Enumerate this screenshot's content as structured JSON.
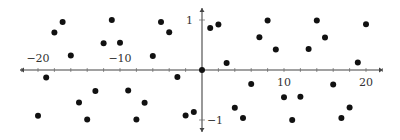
{
  "chart_data": {
    "type": "scatter",
    "title": "",
    "xlabel": "",
    "ylabel": "",
    "xlim": [
      -22,
      22
    ],
    "ylim": [
      -1.2,
      1.3
    ],
    "grid": false,
    "legend": null,
    "x_ticks": [
      {
        "value": -20,
        "label": "−20"
      },
      {
        "value": -10,
        "label": "−10"
      },
      {
        "value": 10,
        "label": "10"
      },
      {
        "value": 20,
        "label": "20"
      }
    ],
    "y_ticks": [
      {
        "value": 1,
        "label": "1"
      },
      {
        "value": -1,
        "label": "−1"
      }
    ],
    "series": [
      {
        "name": "y = sin(x), integer x",
        "color": "#111111",
        "x": [
          -20,
          -19,
          -18,
          -17,
          -16,
          -15,
          -14,
          -13,
          -12,
          -11,
          -10,
          -9,
          -8,
          -7,
          -6,
          -5,
          -4,
          -3,
          -2,
          -1,
          0,
          1,
          2,
          3,
          4,
          5,
          6,
          7,
          8,
          9,
          10,
          11,
          12,
          13,
          14,
          15,
          16,
          17,
          18,
          19,
          20
        ],
        "y": [
          -0.913,
          -0.15,
          0.751,
          0.961,
          0.288,
          -0.65,
          -0.991,
          -0.42,
          0.537,
          1.0,
          0.544,
          -0.412,
          -0.989,
          -0.657,
          0.279,
          0.959,
          0.757,
          -0.141,
          -0.909,
          -0.841,
          0.0,
          0.841,
          0.909,
          0.141,
          -0.757,
          -0.959,
          -0.279,
          0.657,
          0.989,
          0.412,
          -0.544,
          -1.0,
          -0.537,
          0.42,
          0.991,
          0.65,
          -0.288,
          -0.961,
          -0.751,
          0.15,
          0.913
        ]
      }
    ]
  },
  "axes": {
    "axis_color": "#444444",
    "tick_color": "#666666"
  }
}
